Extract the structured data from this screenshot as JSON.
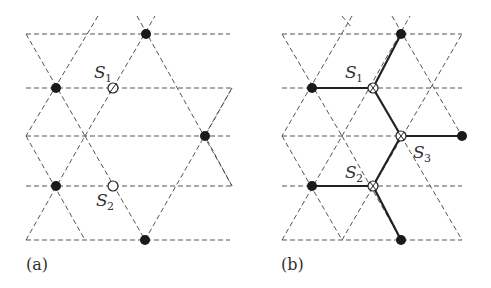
{
  "figure": {
    "colors": {
      "lattice": "#555555",
      "bond": "#222222",
      "dot": "#1a1a1a",
      "text": "#333333"
    }
  },
  "panels": [
    {
      "id": "a",
      "label": "(a)",
      "label_pos": [
        26,
        270
      ],
      "horizontal_lines": [
        {
          "y": 34,
          "x1": 26,
          "x2": 230
        },
        {
          "y": 88,
          "x1": 26,
          "x2": 232
        },
        {
          "y": 136,
          "x1": 26,
          "x2": 230
        },
        {
          "y": 186,
          "x1": 26,
          "x2": 232
        },
        {
          "y": 240,
          "x1": 26,
          "x2": 230
        }
      ],
      "diagonal_lines": [
        {
          "x1": 26,
          "y1": 34,
          "x2": 85,
          "y2": 136
        },
        {
          "x1": 26,
          "y1": 240,
          "x2": 85,
          "y2": 136
        },
        {
          "x1": 85,
          "y1": 136,
          "x2": 145,
          "y2": 240
        },
        {
          "x1": 98,
          "y1": 16,
          "x2": 26,
          "y2": 136
        },
        {
          "x1": 85,
          "y1": 136,
          "x2": 155,
          "y2": 16
        },
        {
          "x1": 137,
          "y1": 16,
          "x2": 232,
          "y2": 186
        },
        {
          "x1": 26,
          "y1": 136,
          "x2": 85,
          "y2": 240
        },
        {
          "x1": 145,
          "y1": 240,
          "x2": 232,
          "y2": 88
        },
        {
          "x1": 232,
          "y1": 88,
          "x2": 205,
          "y2": 136
        },
        {
          "x1": 232,
          "y1": 186,
          "x2": 205,
          "y2": 136
        }
      ],
      "filled_sites": [
        {
          "x": 146,
          "y": 34
        },
        {
          "x": 56,
          "y": 88
        },
        {
          "x": 205,
          "y": 136
        },
        {
          "x": 56,
          "y": 186
        },
        {
          "x": 145,
          "y": 240
        }
      ],
      "open_sites": [
        {
          "x": 113,
          "y": 88,
          "name": "S",
          "sub": "1",
          "label_x": 94,
          "label_y": 78,
          "mark": "slash"
        },
        {
          "x": 113,
          "y": 186,
          "name": "S",
          "sub": "2",
          "label_x": 96,
          "label_y": 206,
          "mark": "none"
        }
      ],
      "bonds": []
    },
    {
      "id": "b",
      "label": "(b)",
      "label_pos": [
        281,
        270
      ],
      "horizontal_lines": [
        {
          "y": 34,
          "x1": 282,
          "x2": 462
        },
        {
          "y": 88,
          "x1": 282,
          "x2": 462
        },
        {
          "y": 136,
          "x1": 282,
          "x2": 462
        },
        {
          "y": 186,
          "x1": 282,
          "x2": 462
        },
        {
          "y": 240,
          "x1": 282,
          "x2": 462
        }
      ],
      "diagonal_lines": [
        {
          "x1": 282,
          "y1": 34,
          "x2": 342,
          "y2": 136
        },
        {
          "x1": 282,
          "y1": 240,
          "x2": 342,
          "y2": 136
        },
        {
          "x1": 342,
          "y1": 136,
          "x2": 401,
          "y2": 240
        },
        {
          "x1": 352,
          "y1": 16,
          "x2": 282,
          "y2": 136
        },
        {
          "x1": 342,
          "y1": 136,
          "x2": 410,
          "y2": 16
        },
        {
          "x1": 392,
          "y1": 16,
          "x2": 462,
          "y2": 136
        },
        {
          "x1": 282,
          "y1": 136,
          "x2": 342,
          "y2": 240
        },
        {
          "x1": 342,
          "y1": 240,
          "x2": 462,
          "y2": 34
        },
        {
          "x1": 401,
          "y1": 136,
          "x2": 462,
          "y2": 240
        },
        {
          "x1": 342,
          "y1": 16,
          "x2": 352,
          "y2": 28
        }
      ],
      "filled_sites": [
        {
          "x": 401,
          "y": 34
        },
        {
          "x": 312,
          "y": 88
        },
        {
          "x": 462,
          "y": 136
        },
        {
          "x": 312,
          "y": 186
        },
        {
          "x": 401,
          "y": 240
        }
      ],
      "open_sites": [
        {
          "x": 373,
          "y": 88,
          "name": "S",
          "sub": "1",
          "label_x": 345,
          "label_y": 78,
          "mark": "cross"
        },
        {
          "x": 401,
          "y": 136,
          "name": "S",
          "sub": "3",
          "label_x": 413,
          "label_y": 158,
          "mark": "cross"
        },
        {
          "x": 373,
          "y": 186,
          "name": "S",
          "sub": "2",
          "label_x": 345,
          "label_y": 178,
          "mark": "cross"
        }
      ],
      "bonds": [
        {
          "x1": 312,
          "y1": 88,
          "x2": 373,
          "y2": 88
        },
        {
          "x1": 373,
          "y1": 88,
          "x2": 401,
          "y2": 34
        },
        {
          "x1": 373,
          "y1": 88,
          "x2": 401,
          "y2": 136
        },
        {
          "x1": 401,
          "y1": 136,
          "x2": 462,
          "y2": 136
        },
        {
          "x1": 401,
          "y1": 136,
          "x2": 373,
          "y2": 186
        },
        {
          "x1": 312,
          "y1": 186,
          "x2": 373,
          "y2": 186
        },
        {
          "x1": 373,
          "y1": 186,
          "x2": 401,
          "y2": 240
        }
      ]
    }
  ]
}
